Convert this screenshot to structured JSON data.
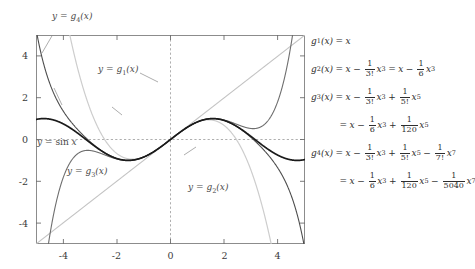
{
  "chart_data": {
    "type": "line",
    "title": "",
    "xlabel": "",
    "ylabel": "",
    "xlim": [
      -5,
      5
    ],
    "ylim": [
      -5,
      5
    ],
    "grid": false,
    "legend_position": "inline-annotations",
    "xticks": [
      "-4",
      "-2",
      "0",
      "2",
      "4"
    ],
    "xtick_values": [
      -4,
      -2,
      0,
      2,
      4
    ],
    "yticks": [
      "4",
      "2",
      "0",
      "-2",
      "-4"
    ],
    "ytick_values": [
      4,
      2,
      0,
      -2,
      -4
    ],
    "series": [
      {
        "name": "y = sin x",
        "expr": "sin(x)",
        "color": "#1a1a1a",
        "width": 1.6,
        "label": "y = sin x"
      },
      {
        "name": "y = g1(x)",
        "expr": "x",
        "color": "#c3c3c3",
        "width": 1.1,
        "label": "y = g₁(x)"
      },
      {
        "name": "y = g2(x)",
        "expr": "x - x^3/6",
        "color": "#cdcdcd",
        "width": 1.1,
        "label": "y = g₂(x)"
      },
      {
        "name": "y = g3(x)",
        "expr": "x - x^3/6 + x^5/120",
        "color": "#6e6e6e",
        "width": 1.1,
        "label": "y = g₃(x)"
      },
      {
        "name": "y = g4(x)",
        "expr": "x - x^3/6 + x^5/120 - x^7/5040",
        "color": "#4d4d4d",
        "width": 1.1,
        "label": "y = g₄(x)"
      }
    ],
    "axis_lines": {
      "style": "dashed",
      "color": "#9a9a9a",
      "x_axis_at_y": 0,
      "y_axis_at_x": 0
    }
  },
  "curve_labels": [
    {
      "id": "g4",
      "text_pre": "y",
      "eq": "=",
      "fn": "g",
      "sub": "4",
      "arg": "(x)"
    },
    {
      "id": "g1",
      "text_pre": "y",
      "eq": "=",
      "fn": "g",
      "sub": "1",
      "arg": "(x)"
    },
    {
      "id": "sin",
      "text_pre": "y",
      "eq": "=",
      "fn": "sin",
      "sub": "",
      "arg": "x"
    },
    {
      "id": "g3",
      "text_pre": "y",
      "eq": "=",
      "fn": "g",
      "sub": "3",
      "arg": "(x)"
    },
    {
      "id": "g2",
      "text_pre": "y",
      "eq": "=",
      "fn": "g",
      "sub": "2",
      "arg": "(x)"
    }
  ],
  "formulas": {
    "lines": [
      {
        "id": "g1",
        "indent": false,
        "lhs": "g",
        "lhs_sub": "1",
        "lhs_arg": "(x)",
        "eq": "=",
        "terms": "x"
      },
      {
        "id": "g2",
        "indent": false,
        "lhs": "g",
        "lhs_sub": "2",
        "lhs_arg": "(x)",
        "eq": "=",
        "terms": "x - (1/3!)x^3 = x - (1/6)x^3"
      },
      {
        "id": "g3",
        "indent": false,
        "lhs": "g",
        "lhs_sub": "3",
        "lhs_arg": "(x)",
        "eq": "=",
        "terms": "x - (1/3!)x^3 + (1/5!)x^5"
      },
      {
        "id": "g3b",
        "indent": true,
        "lhs": "",
        "lhs_sub": "",
        "lhs_arg": "",
        "eq": "=",
        "terms": "x - (1/6)x^3 + (1/120)x^5"
      },
      {
        "id": "g4",
        "indent": false,
        "lhs": "g",
        "lhs_sub": "4",
        "lhs_arg": "(x)",
        "eq": "=",
        "terms": "x - (1/3!)x^3 + (1/5!)x^5 - (1/7!)x^7"
      },
      {
        "id": "g4b",
        "indent": true,
        "lhs": "",
        "lhs_sub": "",
        "lhs_arg": "",
        "eq": "=",
        "terms": "x - (1/6)x^3 + (1/120)x^5 - (1/5040)x^7"
      }
    ],
    "tokens": {
      "x": "x",
      "minus": "−",
      "plus": "+",
      "equals": "=",
      "one": "1",
      "f3": "3!",
      "f5": "5!",
      "f7": "7!",
      "d6": "6",
      "d120": "120",
      "d5040": "5040",
      "p3": "3",
      "p5": "5",
      "p7": "7",
      "g": "g",
      "paren_x": "(x)",
      "s1": "1",
      "s2": "2",
      "s3": "3",
      "s4": "4",
      "y": "y",
      "sin": "sin"
    }
  }
}
